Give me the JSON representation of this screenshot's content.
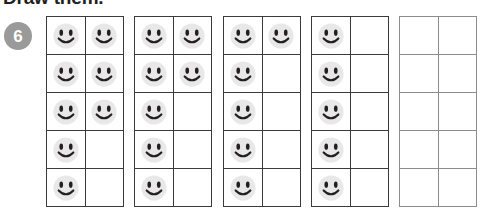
{
  "worksheet": {
    "title": "Draw them.",
    "problem_number": "6",
    "badge_color": "#9a9a9a",
    "grid_line_color": "#3a3a3a",
    "grid_line_color_empty": "#8c8c8c",
    "smiley_face_color": "#e8e8e8",
    "smiley_feature_color": "#231f20"
  },
  "chart_data": {
    "type": "table",
    "title": "Draw them.",
    "rows": 5,
    "columns": 2,
    "frames": [
      {
        "index": 1,
        "count": 8,
        "cells": [
          true,
          true,
          true,
          true,
          true,
          true,
          true,
          false,
          true,
          false
        ]
      },
      {
        "index": 2,
        "count": 7,
        "cells": [
          true,
          true,
          true,
          true,
          true,
          false,
          true,
          false,
          true,
          false
        ]
      },
      {
        "index": 3,
        "count": 6,
        "cells": [
          true,
          true,
          true,
          false,
          true,
          false,
          true,
          false,
          true,
          false
        ]
      },
      {
        "index": 4,
        "count": 5,
        "cells": [
          true,
          false,
          true,
          false,
          true,
          false,
          true,
          false,
          true,
          false
        ]
      },
      {
        "index": 5,
        "count": 0,
        "cells": [
          false,
          false,
          false,
          false,
          false,
          false,
          false,
          false,
          false,
          false
        ]
      }
    ]
  },
  "layout": {
    "frame_positions": [
      46,
      134,
      223,
      311,
      399
    ],
    "icon_names": {
      "filled": "smiley-face-icon",
      "empty": "empty-cell"
    }
  }
}
